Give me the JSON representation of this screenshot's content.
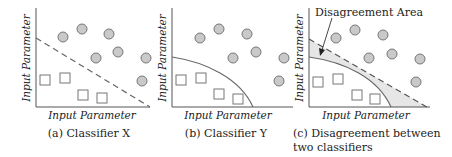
{
  "colors": {
    "axis": "#555555",
    "boundary": "#666666",
    "circle_fill": "#c9c9c9",
    "circle_stroke": "#777777",
    "square_fill": "#ffffff",
    "square_stroke": "#777777",
    "disagreement_fill": "#e6e6e6"
  },
  "panels": [
    {
      "id": "a",
      "x_axis_label": "Input Parameter",
      "y_axis_label": "Input Parameter",
      "caption_line1": "(a) Classifier X",
      "caption_line2": "",
      "boundary": "dashed-line"
    },
    {
      "id": "b",
      "x_axis_label": "Input Parameter",
      "y_axis_label": "Input Parameter",
      "caption_line1": "(b) Classifier Y",
      "caption_line2": "",
      "boundary": "curve"
    },
    {
      "id": "c",
      "x_axis_label": "Input Parameter",
      "y_axis_label": "Input Parameter",
      "caption_line1": "(c) Disagreement between",
      "caption_line2": "two classifiers",
      "boundary": "dashed-line-and-curve",
      "annotation": "Disagreement Area"
    }
  ],
  "legend_semantics": {
    "circle": "class A samples",
    "square": "class B samples"
  }
}
